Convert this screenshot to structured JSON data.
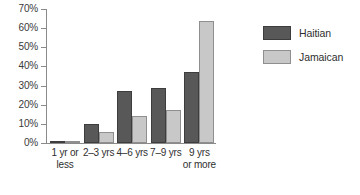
{
  "chart_data": {
    "type": "bar",
    "title": "",
    "subtitle": "",
    "xlabel": "",
    "ylabel": "",
    "ylim": [
      0,
      70
    ],
    "ytick_step": 10,
    "ytick_labels": [
      "0%",
      "10%",
      "20%",
      "30%",
      "40%",
      "50%",
      "60%",
      "70%"
    ],
    "ytick_values": [
      0,
      10,
      20,
      30,
      40,
      50,
      60,
      70
    ],
    "grid": false,
    "legend_position": "right",
    "categories": [
      "1 yr or less",
      "2–3 yrs",
      "4–6 yrs",
      "7–9 yrs",
      "9 yrs or more"
    ],
    "series": [
      {
        "name": "Haitian",
        "color": "#585858",
        "border_color": "#3d3d3d",
        "values": [
          1,
          10,
          27,
          29,
          37
        ]
      },
      {
        "name": "Jamaican",
        "color": "#c8c8c8",
        "border_color": "#8f8f8f",
        "values": [
          1,
          6,
          14,
          17,
          64
        ]
      }
    ]
  },
  "legend": {
    "items": [
      {
        "label": "Haitian"
      },
      {
        "label": "Jamaican"
      }
    ]
  },
  "axis": {
    "y_labels": [
      "70%",
      "60%",
      "50%",
      "40%",
      "30%",
      "20%",
      "10%",
      "0%"
    ],
    "x_labels": [
      "1 yr or\nless",
      "2–3 yrs",
      "4–6 yrs",
      "7–9 yrs",
      "9 yrs\nor more"
    ]
  },
  "colors": {
    "haitian": "#585858",
    "jamaican": "#c8c8c8",
    "axis": "#8a8a8a",
    "text": "#2f2f2f",
    "background": "#ffffff"
  }
}
